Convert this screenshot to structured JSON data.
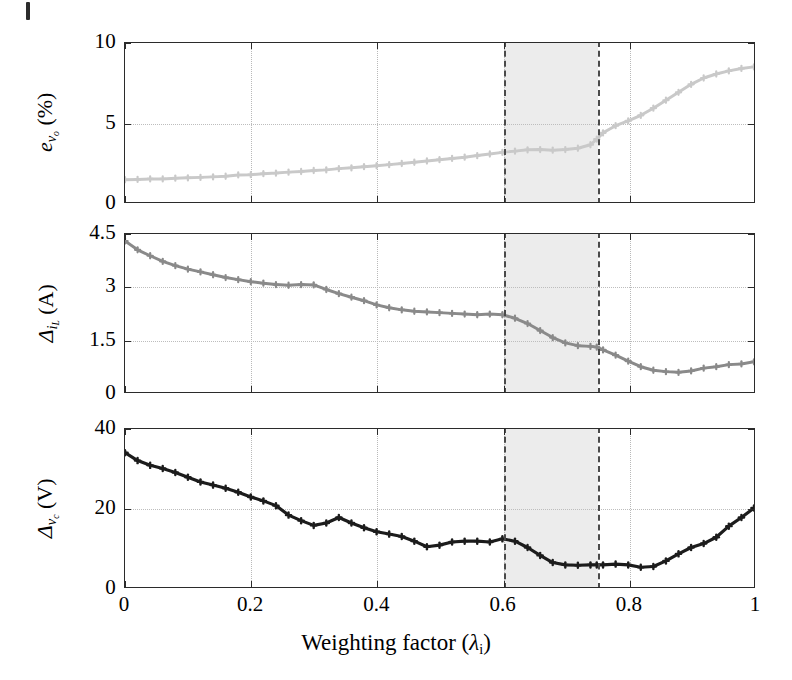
{
  "figure": {
    "xlabel_text": "Weighting factor (",
    "xlabel_symbol": "λ",
    "xlabel_sub": "i",
    "xlabel_close": ")",
    "shaded_band_label": "optimal-weighting-region"
  },
  "x_ticks": [
    {
      "value": 0,
      "label": "0"
    },
    {
      "value": 0.2,
      "label": "0.2"
    },
    {
      "value": 0.4,
      "label": "0.4"
    },
    {
      "value": 0.6,
      "label": "0.6"
    },
    {
      "value": 0.8,
      "label": "0.8"
    },
    {
      "value": 1,
      "label": "1"
    }
  ],
  "panels": [
    {
      "id": "top",
      "ylabel_main": "e",
      "ylabel_sub": "v",
      "ylabel_sub2": "o",
      "ylabel_unit": "(%)",
      "y_ticks": [
        {
          "value": 0,
          "label": "0"
        },
        {
          "value": 5,
          "label": "5"
        },
        {
          "value": 10,
          "label": "10"
        }
      ],
      "color": "#c9c9c9"
    },
    {
      "id": "mid",
      "ylabel_main": "Δ",
      "ylabel_sub": "i",
      "ylabel_sub2": "L",
      "ylabel_unit": "(A)",
      "y_ticks": [
        {
          "value": 0,
          "label": "0"
        },
        {
          "value": 1.5,
          "label": "1.5"
        },
        {
          "value": 3,
          "label": "3"
        },
        {
          "value": 4.5,
          "label": "4.5"
        }
      ],
      "color": "#8a8a8a"
    },
    {
      "id": "bot",
      "ylabel_main": "Δ",
      "ylabel_sub": "v",
      "ylabel_sub2": "c",
      "ylabel_unit": "(V)",
      "y_ticks": [
        {
          "value": 0,
          "label": "0"
        },
        {
          "value": 20,
          "label": "20"
        },
        {
          "value": 40,
          "label": "40"
        }
      ],
      "color": "#1c1c1c"
    }
  ],
  "chart_data": [
    {
      "type": "line",
      "id": "evo",
      "title": "",
      "xlabel": "Weighting factor (λ_i)",
      "ylabel": "e_{v_o} (%)",
      "xlim": [
        0,
        1
      ],
      "ylim": [
        0,
        10
      ],
      "grid": true,
      "legend": "none",
      "color": "#c9c9c9",
      "marker": "cross",
      "annotations": [
        {
          "type": "vspan",
          "x0": 0.6,
          "x1": 0.75,
          "style": "shaded-dashed"
        }
      ],
      "x": [
        0,
        0.02,
        0.04,
        0.06,
        0.08,
        0.1,
        0.12,
        0.14,
        0.16,
        0.18,
        0.2,
        0.22,
        0.24,
        0.26,
        0.28,
        0.3,
        0.32,
        0.34,
        0.36,
        0.38,
        0.4,
        0.42,
        0.44,
        0.46,
        0.48,
        0.5,
        0.52,
        0.54,
        0.56,
        0.58,
        0.6,
        0.62,
        0.64,
        0.66,
        0.68,
        0.7,
        0.72,
        0.74,
        0.75,
        0.76,
        0.78,
        0.8,
        0.82,
        0.84,
        0.86,
        0.88,
        0.9,
        0.92,
        0.94,
        0.96,
        0.98,
        1.0
      ],
      "values": [
        1.4,
        1.42,
        1.45,
        1.45,
        1.5,
        1.52,
        1.55,
        1.58,
        1.62,
        1.7,
        1.72,
        1.78,
        1.82,
        1.88,
        1.92,
        1.98,
        2.02,
        2.1,
        2.15,
        2.22,
        2.28,
        2.35,
        2.42,
        2.5,
        2.58,
        2.66,
        2.74,
        2.82,
        2.92,
        3.02,
        3.12,
        3.2,
        3.28,
        3.3,
        3.26,
        3.3,
        3.38,
        3.6,
        3.95,
        4.35,
        4.8,
        5.1,
        5.45,
        5.9,
        6.4,
        6.9,
        7.4,
        7.8,
        8.05,
        8.25,
        8.4,
        8.5
      ]
    },
    {
      "type": "line",
      "id": "delta_iL",
      "title": "",
      "xlabel": "Weighting factor (λ_i)",
      "ylabel": "Δ_{i_L} (A)",
      "xlim": [
        0,
        1
      ],
      "ylim": [
        0,
        4.5
      ],
      "grid": true,
      "legend": "none",
      "color": "#8a8a8a",
      "marker": "cross",
      "annotations": [
        {
          "type": "vspan",
          "x0": 0.6,
          "x1": 0.75,
          "style": "shaded-dashed"
        }
      ],
      "x": [
        0,
        0.02,
        0.04,
        0.06,
        0.08,
        0.1,
        0.12,
        0.14,
        0.16,
        0.18,
        0.2,
        0.22,
        0.24,
        0.26,
        0.28,
        0.3,
        0.32,
        0.34,
        0.36,
        0.38,
        0.4,
        0.42,
        0.44,
        0.46,
        0.48,
        0.5,
        0.52,
        0.54,
        0.56,
        0.58,
        0.6,
        0.62,
        0.64,
        0.66,
        0.68,
        0.7,
        0.72,
        0.74,
        0.75,
        0.76,
        0.78,
        0.8,
        0.82,
        0.84,
        0.86,
        0.88,
        0.9,
        0.92,
        0.94,
        0.96,
        0.98,
        1.0
      ],
      "values": [
        4.3,
        4.05,
        3.88,
        3.72,
        3.6,
        3.5,
        3.42,
        3.34,
        3.26,
        3.2,
        3.14,
        3.1,
        3.06,
        3.04,
        3.06,
        3.05,
        2.92,
        2.8,
        2.7,
        2.6,
        2.48,
        2.4,
        2.34,
        2.3,
        2.28,
        2.26,
        2.24,
        2.22,
        2.2,
        2.22,
        2.2,
        2.1,
        1.95,
        1.75,
        1.55,
        1.4,
        1.32,
        1.3,
        1.28,
        1.2,
        1.05,
        0.88,
        0.72,
        0.62,
        0.58,
        0.56,
        0.6,
        0.68,
        0.72,
        0.78,
        0.8,
        0.86
      ]
    },
    {
      "type": "line",
      "id": "delta_vc",
      "title": "",
      "xlabel": "Weighting factor (λ_i)",
      "ylabel": "Δ_{v_c} (V)",
      "xlim": [
        0,
        1
      ],
      "ylim": [
        0,
        40
      ],
      "grid": true,
      "legend": "none",
      "color": "#1c1c1c",
      "marker": "cross",
      "annotations": [
        {
          "type": "vspan",
          "x0": 0.6,
          "x1": 0.75,
          "style": "shaded-dashed"
        }
      ],
      "x": [
        0,
        0.02,
        0.04,
        0.06,
        0.08,
        0.1,
        0.12,
        0.14,
        0.16,
        0.18,
        0.2,
        0.22,
        0.24,
        0.26,
        0.28,
        0.3,
        0.32,
        0.34,
        0.36,
        0.38,
        0.4,
        0.42,
        0.44,
        0.46,
        0.48,
        0.5,
        0.52,
        0.54,
        0.56,
        0.58,
        0.6,
        0.62,
        0.64,
        0.66,
        0.68,
        0.7,
        0.72,
        0.74,
        0.75,
        0.76,
        0.78,
        0.8,
        0.82,
        0.84,
        0.86,
        0.88,
        0.9,
        0.92,
        0.94,
        0.96,
        0.98,
        1.0
      ],
      "values": [
        34.0,
        32.0,
        30.8,
        30.0,
        29.0,
        27.8,
        26.6,
        25.8,
        25.0,
        24.0,
        22.8,
        21.8,
        20.6,
        18.2,
        16.8,
        15.6,
        16.2,
        17.6,
        16.2,
        15.0,
        14.0,
        13.4,
        12.8,
        11.6,
        10.2,
        10.6,
        11.4,
        11.6,
        11.6,
        11.4,
        12.2,
        11.6,
        10.0,
        8.0,
        6.2,
        5.6,
        5.5,
        5.6,
        5.6,
        5.6,
        5.8,
        5.6,
        5.0,
        5.2,
        6.6,
        8.4,
        10.0,
        11.0,
        12.6,
        15.4,
        17.6,
        20.0
      ]
    }
  ]
}
